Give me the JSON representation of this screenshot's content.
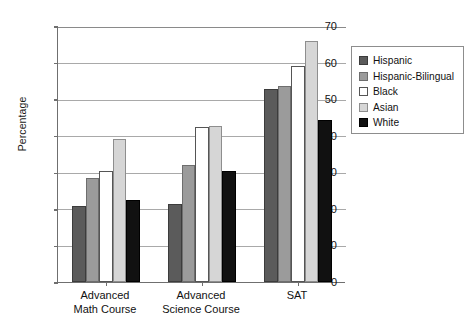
{
  "chart_data": {
    "type": "bar",
    "title": "",
    "xlabel": "",
    "ylabel": "Percentage",
    "ylim": [
      0,
      70
    ],
    "yticks": [
      0,
      10,
      20,
      30,
      40,
      50,
      60,
      70
    ],
    "grid": true,
    "legend_position": "right",
    "categories": [
      "Advanced\nMath Course",
      "Advanced\nScience Course",
      "SAT"
    ],
    "series": [
      {
        "name": "Hispanic",
        "color": "#5b5b5b",
        "values": [
          20.7,
          21.3,
          52.8
        ]
      },
      {
        "name": "Hispanic-Bilingual",
        "color": "#9b9b9b",
        "values": [
          28.5,
          32.0,
          53.5
        ]
      },
      {
        "name": "Black",
        "color": "#ffffff",
        "values": [
          30.3,
          42.3,
          59.0
        ]
      },
      {
        "name": "Asian",
        "color": "#d6d6d6",
        "values": [
          39.0,
          42.7,
          65.8
        ]
      },
      {
        "name": "White",
        "color": "#111111",
        "values": [
          22.3,
          30.4,
          44.2
        ]
      }
    ]
  },
  "axis": {
    "y_title": "Percentage",
    "y_tick_labels": [
      "0",
      "10",
      "20",
      "30",
      "40",
      "50",
      "60",
      "70"
    ]
  },
  "legend": {
    "items": [
      {
        "label": "Hispanic"
      },
      {
        "label": "Hispanic-Bilingual"
      },
      {
        "label": "Black"
      },
      {
        "label": "Asian"
      },
      {
        "label": "White"
      }
    ]
  },
  "x_axis": {
    "groups": [
      {
        "line1": "Advanced",
        "line2": "Math Course"
      },
      {
        "line1": "Advanced",
        "line2": "Science Course"
      },
      {
        "line1": "SAT",
        "line2": ""
      }
    ]
  }
}
